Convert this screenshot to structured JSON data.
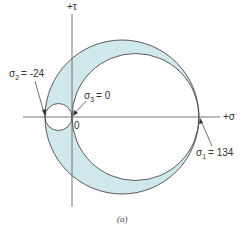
{
  "diagram": {
    "type": "mohr-circle",
    "caption": "(a)",
    "axes": {
      "horizontal_label": "+σ",
      "vertical_label": "+τ",
      "origin_label": "0"
    },
    "principal_stresses": [
      {
        "name": "σ1",
        "sub": "1",
        "value": 134,
        "label": "= 134"
      },
      {
        "name": "σ2",
        "sub": "2",
        "value": -24,
        "label": "= -24"
      },
      {
        "name": "σ3",
        "sub": "3",
        "value": 0,
        "label": "= 0"
      }
    ],
    "circles": [
      {
        "name": "outer",
        "from": "σ2",
        "to": "σ1"
      },
      {
        "name": "large-inner",
        "from": "σ3",
        "to": "σ1"
      },
      {
        "name": "small-inner",
        "from": "σ2",
        "to": "σ3"
      }
    ],
    "colors": {
      "fill": "#cfe8ec",
      "stroke": "#4a4a4a",
      "axis": "#555555",
      "text": "#333333"
    }
  }
}
